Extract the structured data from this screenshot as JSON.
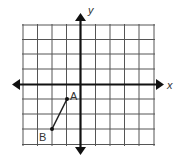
{
  "diagram": {
    "type": "coordinate-plane",
    "axes": {
      "x_label": "x",
      "y_label": "y"
    },
    "grid": {
      "x_range": [
        -4,
        5
      ],
      "y_range": [
        -4,
        5
      ],
      "unit_px": 14.7
    },
    "points": [
      {
        "label": "A",
        "x": -1,
        "y": -1
      },
      {
        "label": "B",
        "x": -2,
        "y": -3
      }
    ],
    "segment": {
      "from": "A",
      "to": "B"
    },
    "colors": {
      "grid": "#555555",
      "axis": "#111111",
      "segment": "#222222"
    }
  }
}
